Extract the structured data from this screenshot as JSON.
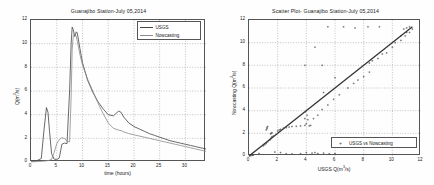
{
  "figure": {
    "background": "#fefefe",
    "line_color_usgs": "#444444",
    "line_color_now": "#8a8a8a",
    "grid_color": "#9a9a9a"
  },
  "panels": [
    {
      "id": "hydrograph",
      "title": "Guanajibo Station-July 05,2014",
      "xlabel": "time (hours)",
      "ylabel": "Q(m³/s)",
      "xticks": [
        0,
        5,
        10,
        15,
        20,
        25,
        30
      ],
      "yticks": [
        0,
        2,
        4,
        6,
        8,
        10,
        12
      ],
      "legend": [
        {
          "label": "USGS",
          "style": "line"
        },
        {
          "label": "Nowcasting",
          "style": "line"
        }
      ]
    },
    {
      "id": "scatter",
      "title": "Scatter Plot- Guanajibo Station-July 05,2014",
      "xlabel": "USGS Q(m³/s)",
      "ylabel": "Nowcasting Q(m³/s)",
      "xticks": [
        0,
        2,
        4,
        6,
        8,
        10,
        12
      ],
      "yticks": [
        0,
        2,
        4,
        6,
        8,
        10,
        12
      ],
      "legend": [
        {
          "label": "USGS vs Nowcasting",
          "style": "marker"
        }
      ]
    }
  ],
  "chart_data": [
    {
      "type": "line",
      "title": "Guanajibo Station-July 05,2014",
      "xlabel": "time (hours)",
      "ylabel": "Q(m³/s)",
      "xlim": [
        0,
        34
      ],
      "ylim": [
        0,
        12
      ],
      "grid": true,
      "legend_position": "top-right",
      "x": [
        0,
        1,
        2,
        2.5,
        3,
        3.3,
        3.6,
        4,
        4.5,
        5,
        5.5,
        6,
        6.5,
        7,
        7.5,
        7.8,
        8,
        8.2,
        8.5,
        8.8,
        9,
        9.5,
        10,
        11,
        12,
        13,
        14,
        15,
        16,
        17,
        17.5,
        18,
        19,
        20,
        21,
        22,
        23,
        24,
        25,
        26,
        27,
        28,
        29,
        30,
        31,
        32,
        33,
        34
      ],
      "series": [
        {
          "name": "USGS",
          "values": [
            0.05,
            0.08,
            0.3,
            2.6,
            4.6,
            4.2,
            2.6,
            0.7,
            0.25,
            0.2,
            0.35,
            1.5,
            1.6,
            1.55,
            6.0,
            10.0,
            11.4,
            11.2,
            10.6,
            11.0,
            10.9,
            9.6,
            8.4,
            6.9,
            5.9,
            5.1,
            4.5,
            4.0,
            3.9,
            4.3,
            4.2,
            3.8,
            3.3,
            3.0,
            2.8,
            2.6,
            2.4,
            2.25,
            2.1,
            1.95,
            1.8,
            1.7,
            1.6,
            1.5,
            1.4,
            1.3,
            1.2,
            1.1
          ]
        },
        {
          "name": "Nowcasting",
          "values": [
            0.02,
            0.03,
            0.05,
            0.07,
            0.1,
            0.12,
            0.16,
            0.22,
            0.8,
            1.55,
            1.9,
            2.05,
            2.0,
            1.75,
            1.7,
            5.5,
            9.5,
            10.6,
            10.9,
            10.6,
            10.2,
            9.1,
            8.2,
            7.0,
            6.0,
            5.0,
            4.1,
            3.3,
            2.85,
            2.7,
            2.65,
            2.55,
            2.4,
            2.3,
            2.2,
            2.1,
            2.0,
            1.9,
            1.8,
            1.7,
            1.6,
            1.5,
            1.4,
            1.3,
            1.2,
            1.1,
            1.0,
            0.9
          ]
        }
      ]
    },
    {
      "type": "scatter",
      "title": "Scatter Plot- Guanajibo Station-July 05,2014",
      "xlabel": "USGS Q(m³/s)",
      "ylabel": "Nowcasting Q(m³/s)",
      "xlim": [
        0,
        12
      ],
      "ylim": [
        0,
        12
      ],
      "grid": true,
      "legend_position": "bottom-right",
      "reference_line": {
        "name": "1:1 line",
        "from": [
          0,
          0
        ],
        "to": [
          11.4,
          11.4
        ]
      },
      "points": [
        [
          0.05,
          0.02
        ],
        [
          0.08,
          0.03
        ],
        [
          0.2,
          0.05
        ],
        [
          0.3,
          0.07
        ],
        [
          0.7,
          0.22
        ],
        [
          0.25,
          0.1
        ],
        [
          1.0,
          0.9
        ],
        [
          1.1,
          1.0
        ],
        [
          1.2,
          1.1
        ],
        [
          1.3,
          1.25
        ],
        [
          1.45,
          1.4
        ],
        [
          1.5,
          1.5
        ],
        [
          1.55,
          1.6
        ],
        [
          1.6,
          1.7
        ],
        [
          1.7,
          1.75
        ],
        [
          1.5,
          1.95
        ],
        [
          1.55,
          2.0
        ],
        [
          1.6,
          2.05
        ],
        [
          1.2,
          2.3
        ],
        [
          1.25,
          2.5
        ],
        [
          1.3,
          2.6
        ],
        [
          1.25,
          2.4
        ],
        [
          2.0,
          2.2
        ],
        [
          2.1,
          2.3
        ],
        [
          2.2,
          2.35
        ],
        [
          2.4,
          2.45
        ],
        [
          2.6,
          2.5
        ],
        [
          2.8,
          2.55
        ],
        [
          3.0,
          2.6
        ],
        [
          3.3,
          2.62
        ],
        [
          3.6,
          2.65
        ],
        [
          3.9,
          2.7
        ],
        [
          4.0,
          2.85
        ],
        [
          4.1,
          3.2
        ],
        [
          4.05,
          3.6
        ],
        [
          3.95,
          3.9
        ],
        [
          3.9,
          3.3
        ],
        [
          4.3,
          2.7
        ],
        [
          4.2,
          2.65
        ],
        [
          4.5,
          3.3
        ],
        [
          4.8,
          3.6
        ],
        [
          5.1,
          4.1
        ],
        [
          5.5,
          4.5
        ],
        [
          5.9,
          5.0
        ],
        [
          6.3,
          5.4
        ],
        [
          6.9,
          6.0
        ],
        [
          7.3,
          6.4
        ],
        [
          7.6,
          6.7
        ],
        [
          8.0,
          7.0
        ],
        [
          8.4,
          7.4
        ],
        [
          8.4,
          8.2
        ],
        [
          8.6,
          8.4
        ],
        [
          9.0,
          8.6
        ],
        [
          9.3,
          9.0
        ],
        [
          9.6,
          9.1
        ],
        [
          10.0,
          9.6
        ],
        [
          10.2,
          10.0
        ],
        [
          10.6,
          10.2
        ],
        [
          10.6,
          10.6
        ],
        [
          10.9,
          10.6
        ],
        [
          11.0,
          10.9
        ],
        [
          11.2,
          10.9
        ],
        [
          11.4,
          11.2
        ],
        [
          11.2,
          11.4
        ],
        [
          11.0,
          11.3
        ],
        [
          10.8,
          11.2
        ],
        [
          5.5,
          11.4
        ],
        [
          6.6,
          11.4
        ],
        [
          7.4,
          11.3
        ],
        [
          8.3,
          11.4
        ],
        [
          9.1,
          11.4
        ],
        [
          4.6,
          9.6
        ],
        [
          5.1,
          8.0
        ],
        [
          3.9,
          8.0
        ],
        [
          6.0,
          6.9
        ],
        [
          5.2,
          5.6
        ],
        [
          2.6,
          0.2
        ],
        [
          3.0,
          0.18
        ],
        [
          3.6,
          0.2
        ],
        [
          4.4,
          0.25
        ],
        [
          4.8,
          0.22
        ],
        [
          5.2,
          0.25
        ],
        [
          5.6,
          0.2
        ],
        [
          6.0,
          0.22
        ],
        [
          2.2,
          0.3
        ],
        [
          1.8,
          0.35
        ],
        [
          4.0,
          0.3
        ],
        [
          4.6,
          0.3
        ]
      ]
    }
  ]
}
